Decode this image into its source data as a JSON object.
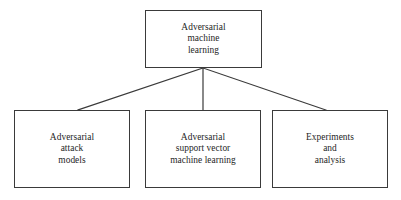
{
  "diagram": {
    "type": "hierarchy-tree",
    "orientation": "top-down",
    "background_color": "#ffffff",
    "border_color": "#3a3a3a",
    "text_color": "#262626",
    "root": {
      "id": "adversarial-machine-learning",
      "label": "Adversarial\nmachine\nlearning",
      "lines": [
        "Adversarial",
        "machine",
        "learning"
      ]
    },
    "children": [
      {
        "id": "adversarial-attack-models",
        "label": "Adversarial\nattack\nmodels",
        "lines": [
          "Adversarial",
          "attack",
          "models"
        ]
      },
      {
        "id": "adversarial-support-vector-machine-learning",
        "label": "Adversarial\nsupport vector\nmachine learning",
        "lines": [
          "Adversarial",
          "support vector",
          "machine learning"
        ]
      },
      {
        "id": "experiments-and-analysis",
        "label": "Experiments\nand\nanalysis",
        "lines": [
          "Experiments",
          "and",
          "analysis"
        ]
      }
    ],
    "connectors": [
      {
        "name": "root-to-attack-models",
        "from": [
          203,
          68
        ],
        "to": [
          78,
          110
        ]
      },
      {
        "name": "root-to-svm",
        "from": [
          203,
          68
        ],
        "to": [
          203,
          110
        ]
      },
      {
        "name": "root-to-experiments",
        "from": [
          203,
          68
        ],
        "to": [
          326,
          110
        ]
      }
    ]
  }
}
